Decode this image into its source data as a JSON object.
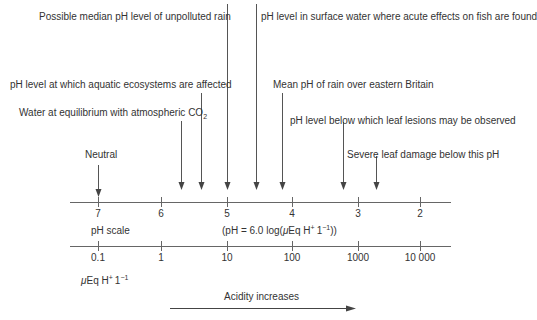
{
  "annotations": [
    {
      "id": "unpolluted",
      "text": "Possible median pH level of unpolluted rain",
      "ph": 5.0
    },
    {
      "id": "fish",
      "text": "pH level in surface water where acute effects on fish are found",
      "ph": 4.55
    },
    {
      "id": "aquatic",
      "text": "pH level at which aquatic ecosystems are affected",
      "ph": 5.4
    },
    {
      "id": "mean_rain",
      "text": "Mean pH of rain over eastern Britain",
      "ph": 4.15
    },
    {
      "id": "co2_prefix",
      "text": "Water at equilibrium with atmospheric CO",
      "ph": 5.7
    },
    {
      "id": "leaf_lesions",
      "text": "pH level below which leaf lesions may be observed",
      "ph": 3.25
    },
    {
      "id": "neutral",
      "text": "Neutral",
      "ph": 7.0
    },
    {
      "id": "severe",
      "text": "Severe leaf damage below this pH",
      "ph": 2.75
    }
  ],
  "co2_subscript": "2",
  "ph_axis": {
    "label": "pH scale",
    "ticks": [
      "7",
      "6",
      "5",
      "4",
      "3",
      "2"
    ]
  },
  "formula": {
    "prefix": "(pH = 6.0  log(",
    "mu": "μ",
    "unit": "Eq H",
    "plus": "+",
    "mid": "1",
    "exp": "−1",
    "suffix": "))"
  },
  "conc_axis": {
    "ticks": [
      "0.1",
      "1",
      "10",
      "100",
      "1000",
      "10 000"
    ],
    "unit_mu": "μ",
    "unit_main": "Eq H",
    "unit_plus": "+",
    "unit_l": "1",
    "unit_exp": "−1"
  },
  "acidity": {
    "label": "Acidity increases"
  }
}
